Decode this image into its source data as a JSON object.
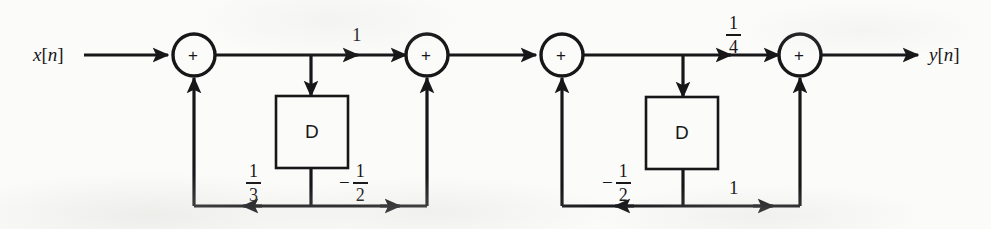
{
  "figure": {
    "background_color": "#fbfbf9",
    "ink_color": "#17171a"
  },
  "io": {
    "input_label": "x[n]",
    "output_label": "y[n]"
  },
  "adders": [
    {
      "id": "adder-1",
      "symbol": "+"
    },
    {
      "id": "adder-2",
      "symbol": "+"
    },
    {
      "id": "adder-3",
      "symbol": "+"
    },
    {
      "id": "adder-4",
      "symbol": "+"
    }
  ],
  "delay_blocks": [
    {
      "id": "delay-1",
      "label": "D"
    },
    {
      "id": "delay-2",
      "label": "D"
    }
  ],
  "gains": {
    "section1": {
      "forward": {
        "label": "1",
        "kind": "integer",
        "value": "1"
      },
      "feedback_left": {
        "label": "1/3",
        "kind": "fraction",
        "sign": "",
        "numerator": "1",
        "denominator": "3"
      },
      "feedback_right": {
        "label": "-1/2",
        "kind": "fraction",
        "sign": "−",
        "numerator": "1",
        "denominator": "2"
      }
    },
    "section2": {
      "forward": {
        "label": "1/4",
        "kind": "fraction",
        "sign": "",
        "numerator": "1",
        "denominator": "4"
      },
      "feedback_left": {
        "label": "-1/2",
        "kind": "fraction",
        "sign": "−",
        "numerator": "1",
        "denominator": "2"
      },
      "feedback_right": {
        "label": "1",
        "kind": "integer",
        "value": "1"
      }
    }
  }
}
